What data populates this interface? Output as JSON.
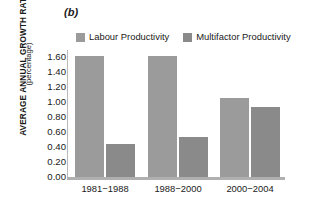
{
  "panel": {
    "label": "(b)"
  },
  "axis": {
    "ylabel_main": "AVERAGE ANNUAL GROWTH RATE",
    "ylabel_sub": "(percentage)"
  },
  "colors": {
    "labour": "#9b9b9b",
    "multifactor": "#8a8a8a",
    "axis": "#b0b0b0",
    "text": "#1a1a1a"
  },
  "legend": {
    "items": [
      {
        "label": "Labour Productivity",
        "color": "#9b9b9b"
      },
      {
        "label": "Multifactor Productivity",
        "color": "#8a8a8a"
      }
    ]
  },
  "chart_data": {
    "type": "bar",
    "title": "(b)",
    "xlabel": "",
    "ylabel": "AVERAGE ANNUAL GROWTH RATE (percentage)",
    "categories": [
      "1981−1988",
      "1988−2000",
      "2000−2004"
    ],
    "series": [
      {
        "name": "Labour Productivity",
        "color": "#9b9b9b",
        "values": [
          1.62,
          1.62,
          1.05
        ]
      },
      {
        "name": "Multifactor Productivity",
        "color": "#8a8a8a",
        "values": [
          0.44,
          0.54,
          0.93
        ]
      }
    ],
    "ylim": [
      0.0,
      1.6
    ],
    "yticks": [
      "1.60",
      "1.40",
      "1.20",
      "1.00",
      "0.80",
      "0.60",
      "0.40",
      "0.20",
      "0.00"
    ],
    "ytick_values": [
      1.6,
      1.4,
      1.2,
      1.0,
      0.8,
      0.6,
      0.4,
      0.2,
      0.0
    ],
    "grid": false,
    "legend_position": "top"
  }
}
